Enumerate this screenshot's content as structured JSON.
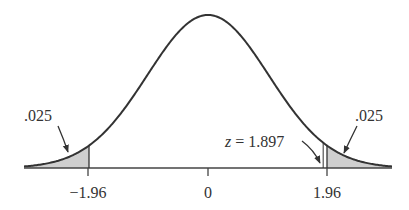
{
  "chart_data": {
    "type": "area",
    "title": "",
    "xlabel": "",
    "ylabel": "",
    "x_ticks": [
      "-1.96",
      "0",
      "1.96"
    ],
    "tail_areas": {
      "left": ".025",
      "right": ".025"
    },
    "critical_values": [
      -1.96,
      1.96
    ],
    "test_statistic": {
      "label": "z = 1.897",
      "value": 1.897
    },
    "colors": {
      "curve": "#333333",
      "shade": "#cfcfcf"
    }
  },
  "labels": {
    "left_tail": ".025",
    "right_tail": ".025",
    "tick_neg": "−1.96",
    "tick_zero": "0",
    "tick_pos": "1.96",
    "z_var": "z",
    "z_eq": " = 1.897"
  }
}
